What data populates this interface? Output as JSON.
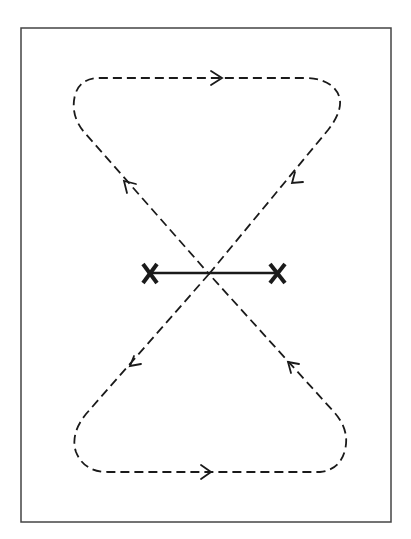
{
  "diagram": {
    "type": "figure-eight flight path",
    "frame": {
      "x": 21,
      "y": 28,
      "width": 370,
      "height": 494,
      "stroke": "#444444"
    },
    "colors": {
      "line": "#1a1a1a",
      "background": "#ffffff"
    },
    "markers": [
      {
        "label": "X",
        "x": 150,
        "y": 273
      },
      {
        "label": "X",
        "x": 278,
        "y": 273
      }
    ],
    "baseline": {
      "x1": 150,
      "y1": 273,
      "x2": 278,
      "y2": 273
    },
    "crossing": {
      "x": 209,
      "y": 274
    },
    "arrows": [
      {
        "position": "top",
        "direction": "right"
      },
      {
        "position": "upper-right-diagonal",
        "direction": "down-left"
      },
      {
        "position": "upper-left-diagonal",
        "direction": "up-left"
      },
      {
        "position": "lower-left-diagonal",
        "direction": "down-left"
      },
      {
        "position": "lower-right-diagonal",
        "direction": "up-left"
      },
      {
        "position": "bottom",
        "direction": "right"
      }
    ]
  }
}
